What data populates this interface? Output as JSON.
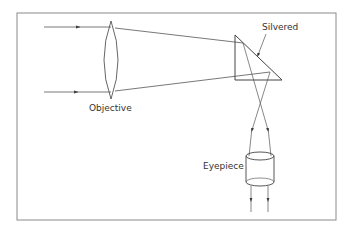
{
  "diagram": {
    "labels": {
      "objective": "Objective",
      "silvered": "Silvered",
      "eyepiece": "Eyepiece"
    },
    "colors": {
      "frame": "#8a8a8a",
      "line": "#555555",
      "text": "#333333",
      "background": "#ffffff"
    },
    "components": [
      {
        "name": "objective-lens",
        "type": "convex lens"
      },
      {
        "name": "prism",
        "type": "right-angle prism",
        "note": "hypotenuse silvered"
      },
      {
        "name": "eyepiece",
        "type": "cylinder lens"
      }
    ],
    "rays": [
      {
        "name": "upper-incoming-ray"
      },
      {
        "name": "lower-incoming-ray"
      }
    ]
  }
}
